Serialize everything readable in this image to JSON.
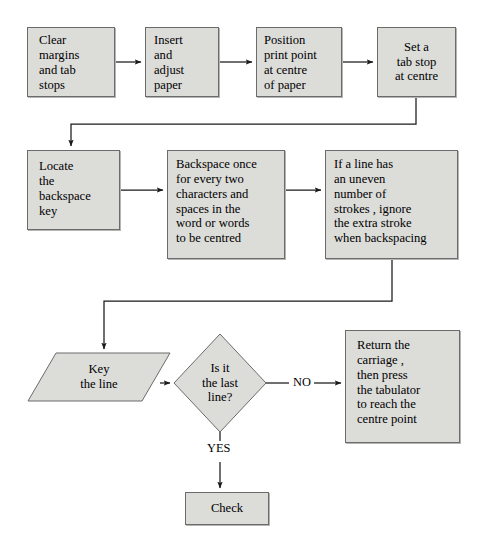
{
  "diagram": {
    "colors": {
      "node_fill": "#dcdcd9",
      "node_border": "#6b6b6b",
      "line": "#1a1a1a",
      "background": "#ffffff",
      "text": "#000000"
    },
    "nodes": [
      {
        "id": "clear-margins",
        "shape": "process",
        "text": "Clear\nmargins\nand tab\nstops",
        "x": 27,
        "y": 27,
        "w": 88,
        "h": 70
      },
      {
        "id": "insert-paper",
        "shape": "process",
        "text": "Insert\nand\nadjust\npaper",
        "x": 145,
        "y": 27,
        "w": 74,
        "h": 70
      },
      {
        "id": "position-print-point",
        "shape": "process",
        "text": "Position\nprint point\nat centre\nof paper",
        "x": 256,
        "y": 27,
        "w": 86,
        "h": 70
      },
      {
        "id": "set-tab-stop",
        "shape": "process",
        "text": "Set a\ntab stop\nat centre",
        "x": 377,
        "y": 27,
        "w": 79,
        "h": 70
      },
      {
        "id": "locate-backspace-key",
        "shape": "process",
        "text": "Locate\nthe\nbackspace\nkey",
        "x": 27,
        "y": 150,
        "w": 93,
        "h": 80
      },
      {
        "id": "backspace-once",
        "shape": "process",
        "text": "Backspace once\nfor every two\ncharacters and\nspaces in the\nword or words\nto be centred",
        "x": 167,
        "y": 150,
        "w": 118,
        "h": 109
      },
      {
        "id": "uneven-strokes",
        "shape": "process",
        "text": "If a line has\nan uneven\nnumber of\nstrokes , ignore\nthe extra stroke\nwhen backspacing",
        "x": 325,
        "y": 150,
        "w": 133,
        "h": 109
      },
      {
        "id": "key-the-line",
        "shape": "io-parallelogram",
        "text": "Key\nthe line",
        "x": 28,
        "y": 353,
        "w": 142,
        "h": 48
      },
      {
        "id": "is-it-the-last-line",
        "shape": "decision",
        "text": "Is it\nthe last\nline?",
        "cx": 220,
        "cy": 383,
        "rx": 46,
        "ry": 49
      },
      {
        "id": "return-carriage",
        "shape": "process",
        "text": "Return the\ncarriage ,\nthen press\nthe tabulator\nto reach the\ncentre point",
        "x": 345,
        "y": 330,
        "w": 115,
        "h": 113
      },
      {
        "id": "check",
        "shape": "process",
        "text": "Check",
        "x": 185,
        "y": 492,
        "w": 84,
        "h": 33
      }
    ],
    "edge_labels": [
      {
        "id": "label-no",
        "text": "NO",
        "x": 293,
        "y": 375
      },
      {
        "id": "label-yes",
        "text": "YES",
        "x": 205,
        "y": 441
      }
    ],
    "connectors": [
      {
        "id": "clear-to-insert",
        "from": "clear-margins",
        "to": "insert-paper",
        "kind": "arrow-right"
      },
      {
        "id": "insert-to-position",
        "from": "insert-paper",
        "to": "position-print-point",
        "kind": "arrow-right"
      },
      {
        "id": "position-to-settab",
        "from": "position-print-point",
        "to": "set-tab-stop",
        "kind": "arrow-right"
      },
      {
        "id": "settab-to-locate",
        "from": "set-tab-stop",
        "to": "locate-backspace-key",
        "kind": "elbow-down-left-down"
      },
      {
        "id": "locate-to-backspace",
        "from": "locate-backspace-key",
        "to": "backspace-once",
        "kind": "arrow-right"
      },
      {
        "id": "backspace-to-uneven",
        "from": "backspace-once",
        "to": "uneven-strokes",
        "kind": "arrow-right"
      },
      {
        "id": "uneven-to-key",
        "from": "uneven-strokes",
        "to": "key-the-line",
        "kind": "elbow-down-left-down"
      },
      {
        "id": "key-to-decision",
        "from": "key-the-line",
        "to": "is-it-the-last-line",
        "kind": "arrow-right"
      },
      {
        "id": "decision-no-to-return",
        "from": "is-it-the-last-line",
        "to": "return-carriage",
        "kind": "arrow-right-labeled",
        "label": "NO"
      },
      {
        "id": "decision-yes-to-check",
        "from": "is-it-the-last-line",
        "to": "check",
        "kind": "arrow-down-labeled",
        "label": "YES"
      }
    ]
  }
}
